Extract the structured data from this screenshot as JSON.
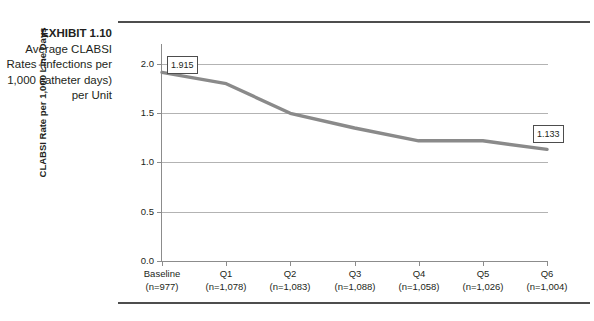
{
  "exhibit": {
    "number_label": "EXHIBIT 1.10",
    "caption": "Average CLABSI Rates (infections per 1,000 catheter days) per Unit"
  },
  "chart_data": {
    "type": "line",
    "title": "",
    "xlabel": "",
    "ylabel": "CLABSI Rate per 1,000 Line Days",
    "categories": [
      "Baseline",
      "Q1",
      "Q2",
      "Q3",
      "Q4",
      "Q5",
      "Q6"
    ],
    "category_sublabels": [
      "(n=977)",
      "(n=1,078)",
      "(n=1,083)",
      "(n=1,088)",
      "(n=1,058)",
      "(n=1,026)",
      "(n=1,004)"
    ],
    "values": [
      1.915,
      1.8,
      1.5,
      1.35,
      1.22,
      1.22,
      1.133
    ],
    "ylim": [
      0.0,
      2.0
    ],
    "yticks": [
      0.0,
      0.5,
      1.0,
      1.5,
      2.0
    ],
    "ytick_labels": [
      "0.0",
      "0.5",
      "1.0",
      "1.5",
      "2.0"
    ],
    "grid": true,
    "legend": "none",
    "series_color": "#8a8a8a",
    "annotations": [
      {
        "label": "1.915",
        "point_index": 0
      },
      {
        "label": "1.133",
        "point_index": 6
      }
    ]
  }
}
